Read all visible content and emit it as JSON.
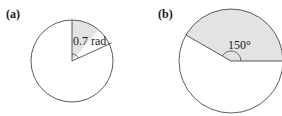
{
  "figure": {
    "panels": [
      {
        "id": "a",
        "label": "(a)",
        "angle_label": "0.7 rad",
        "angle_value": 0.7,
        "angle_unit": "rad",
        "sector_fill": "#e3e3e3"
      },
      {
        "id": "b",
        "label": "(b)",
        "angle_label": "150°",
        "angle_value": 150,
        "angle_unit": "deg",
        "sector_fill": "#e3e3e3"
      }
    ],
    "colors": {
      "stroke": "#333333",
      "background": "#ffffff"
    }
  }
}
